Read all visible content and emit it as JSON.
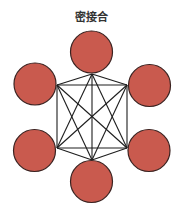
{
  "title": "密接合",
  "colors": {
    "node_fill": "#c95a4e",
    "node_stroke": "#3a2220",
    "edge_stroke": "#1e1e1e",
    "background": "#ffffff"
  },
  "diagram": {
    "type": "complete-graph",
    "node_count": 6,
    "node_radius": 21,
    "vertices": [
      {
        "id": "top",
        "x": 92,
        "y": 74
      },
      {
        "id": "upper-right",
        "x": 127,
        "y": 85
      },
      {
        "id": "lower-right",
        "x": 127,
        "y": 148
      },
      {
        "id": "bottom",
        "x": 92,
        "y": 160
      },
      {
        "id": "lower-left",
        "x": 57,
        "y": 148
      },
      {
        "id": "upper-left",
        "x": 57,
        "y": 85
      }
    ],
    "nodes": [
      {
        "id": "top",
        "cx": 91.5,
        "cy": 52
      },
      {
        "id": "upper-right",
        "cx": 149.5,
        "cy": 85.5
      },
      {
        "id": "lower-right",
        "cx": 149,
        "cy": 150.5
      },
      {
        "id": "bottom",
        "cx": 91.5,
        "cy": 181.5
      },
      {
        "id": "lower-left",
        "cx": 34.5,
        "cy": 150.5
      },
      {
        "id": "upper-left",
        "cx": 35,
        "cy": 84
      }
    ]
  }
}
